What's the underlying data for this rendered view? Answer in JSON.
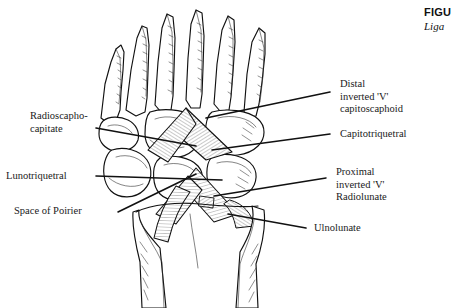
{
  "figure": {
    "caption_label": "FIGU",
    "caption_legend": "Liga",
    "illustration_name": "volar wrist ligaments line drawing"
  },
  "labels": {
    "radioscaphocapitate": {
      "line1": "Radioscapho-",
      "line2": "capitate"
    },
    "lunotriquetral": {
      "line1": "Lunotriquetral"
    },
    "space_of_poirier": {
      "line1": "Space of Poirier"
    },
    "distal_inverted_v": {
      "line1": "Distal",
      "line2": "inverted 'V'",
      "line3": "capitoscaphoid"
    },
    "capitotriquetral": {
      "line1": "Capitotriquetral"
    },
    "proximal_inverted_v": {
      "line1": "Proximal",
      "line2": "inverted 'V'",
      "line3": "Radiolunate"
    },
    "ulnolunate": {
      "line1": "Ulnolunate"
    }
  },
  "colors": {
    "ink": "#111111",
    "background": "#ffffff",
    "hatch": "#444444"
  }
}
